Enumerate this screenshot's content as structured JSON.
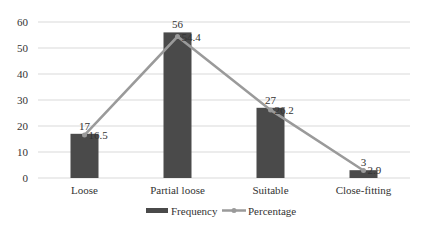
{
  "chart_data": {
    "type": "bar",
    "title": "",
    "xlabel": "",
    "ylabel": "",
    "categories": [
      "Loose",
      "Partial loose",
      "Suitable",
      "Close-fitting"
    ],
    "series": [
      {
        "name": "Frequency",
        "type": "bar",
        "values": [
          17,
          56,
          27,
          3
        ],
        "color": "#4a4a4a"
      },
      {
        "name": "Percentage",
        "type": "line",
        "values": [
          16.5,
          54.4,
          26.2,
          2.9
        ],
        "color": "#9a9a9a"
      }
    ],
    "ylim": [
      0,
      60
    ],
    "yticks": [
      0,
      10,
      20,
      30,
      40,
      50,
      60
    ],
    "grid": true,
    "legend_position": "bottom"
  },
  "legend": {
    "frequency": "Frequency",
    "percentage": "Percentage"
  }
}
